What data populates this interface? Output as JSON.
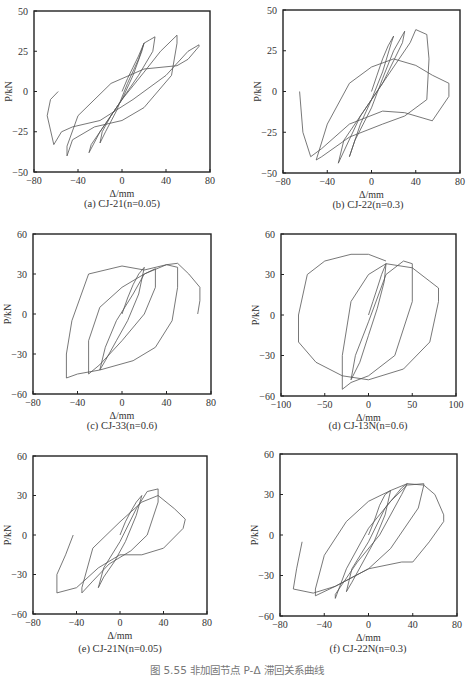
{
  "figure_caption": "图 5.55  非加固节点 P-Δ 滞回关系曲线",
  "chart_data": [
    {
      "id": "a",
      "type": "line",
      "title": "(a) CJ-21(n=0.05)",
      "xlabel": "Δ/mm",
      "ylabel": "P/kN",
      "xlim": [
        -80,
        80
      ],
      "ylim": [
        -50,
        50
      ],
      "xticks": [
        -80,
        -40,
        0,
        40,
        80
      ],
      "yticks": [
        -50,
        -25,
        0,
        25,
        50
      ],
      "grid": false,
      "series": [
        {
          "name": "hysteresis",
          "x": [
            0,
            5,
            10,
            15,
            20,
            18,
            10,
            0,
            -10,
            -18,
            -20,
            -15,
            -5,
            5,
            15,
            20,
            25,
            30,
            28,
            15,
            0,
            -15,
            -28,
            -30,
            -20,
            0,
            20,
            35,
            50,
            50,
            45,
            20,
            0,
            -25,
            -45,
            -50,
            -50,
            -40,
            -10,
            20,
            50,
            60,
            70,
            70,
            60,
            40,
            10,
            -20,
            -45,
            -55,
            -62,
            -68,
            -65,
            -58
          ],
          "y": [
            0,
            8,
            15,
            22,
            30,
            25,
            10,
            -5,
            -15,
            -25,
            -32,
            -25,
            -12,
            5,
            20,
            30,
            32,
            34,
            25,
            10,
            -5,
            -20,
            -33,
            -38,
            -25,
            -5,
            12,
            25,
            35,
            30,
            10,
            -10,
            -18,
            -22,
            -30,
            -40,
            -34,
            -15,
            5,
            14,
            16,
            20,
            28,
            29,
            25,
            10,
            -5,
            -18,
            -22,
            -25,
            -33,
            -15,
            -5,
            0
          ]
        }
      ]
    },
    {
      "id": "b",
      "type": "line",
      "title": "(b) CJ-22(n=0.3)",
      "xlabel": "Δ/mm",
      "ylabel": "P/kN",
      "xlim": [
        -80,
        80
      ],
      "ylim": [
        -50,
        50
      ],
      "xticks": [
        -80,
        -40,
        0,
        40,
        80
      ],
      "yticks": [
        -50,
        -25,
        0,
        25,
        50
      ],
      "grid": false,
      "series": [
        {
          "name": "hysteresis",
          "x": [
            0,
            5,
            10,
            15,
            20,
            18,
            10,
            0,
            -10,
            -20,
            -15,
            0,
            10,
            20,
            30,
            28,
            10,
            -10,
            -30,
            -25,
            0,
            20,
            35,
            40,
            50,
            52,
            50,
            30,
            10,
            -20,
            -45,
            -50,
            -40,
            -20,
            0,
            20,
            40,
            55,
            70,
            70,
            55,
            30,
            10,
            -20,
            -45,
            -55,
            -62,
            -65
          ],
          "y": [
            0,
            10,
            20,
            28,
            34,
            30,
            12,
            -5,
            -20,
            -40,
            -30,
            -10,
            8,
            25,
            37,
            30,
            5,
            -15,
            -44,
            -30,
            -5,
            15,
            30,
            38,
            35,
            20,
            -5,
            -15,
            -20,
            -28,
            -40,
            -42,
            -20,
            5,
            15,
            20,
            16,
            10,
            5,
            -3,
            -18,
            -13,
            -12,
            -20,
            -35,
            -40,
            -25,
            0
          ]
        }
      ]
    },
    {
      "id": "c",
      "type": "line",
      "title": "(c) CJ-33(n=0.6)",
      "xlabel": "Δ/mm",
      "ylabel": "P/kN",
      "xlim": [
        -80,
        80
      ],
      "ylim": [
        -60,
        60
      ],
      "xticks": [
        -80,
        -40,
        0,
        40,
        80
      ],
      "yticks": [
        -60,
        -30,
        0,
        30,
        60
      ],
      "grid": false,
      "series": [
        {
          "name": "hysteresis",
          "x": [
            0,
            5,
            10,
            15,
            20,
            15,
            5,
            -5,
            -15,
            -20,
            -15,
            -5,
            10,
            20,
            30,
            30,
            20,
            0,
            -20,
            -30,
            -30,
            -20,
            0,
            20,
            40,
            50,
            50,
            45,
            30,
            10,
            -20,
            -40,
            -50,
            -50,
            -45,
            -30,
            0,
            20,
            40,
            50,
            60,
            70,
            70,
            68
          ],
          "y": [
            0,
            12,
            22,
            30,
            35,
            15,
            -5,
            -20,
            -35,
            -42,
            -25,
            -5,
            15,
            30,
            34,
            20,
            0,
            -20,
            -38,
            -45,
            -20,
            5,
            20,
            30,
            37,
            35,
            20,
            -5,
            -25,
            -35,
            -42,
            -45,
            -48,
            -30,
            -5,
            30,
            36,
            33,
            37,
            38,
            30,
            20,
            10,
            0
          ]
        }
      ]
    },
    {
      "id": "d",
      "type": "line",
      "title": "(d) CJ-13N(n=0.6)",
      "xlabel": "Δ/mm",
      "ylabel": "P/kN",
      "xlim": [
        -100,
        100
      ],
      "ylim": [
        -60,
        60
      ],
      "xticks": [
        -100,
        -50,
        0,
        50,
        100
      ],
      "yticks": [
        -60,
        -30,
        0,
        30,
        60
      ],
      "grid": false,
      "series": [
        {
          "name": "hysteresis",
          "x": [
            0,
            5,
            10,
            15,
            20,
            18,
            10,
            0,
            -10,
            -20,
            -15,
            0,
            20,
            40,
            50,
            50,
            30,
            0,
            -20,
            -30,
            -30,
            -20,
            0,
            20,
            50,
            70,
            80,
            80,
            70,
            40,
            0,
            -30,
            -60,
            -80,
            -80,
            -70,
            -50,
            -20,
            0,
            20
          ],
          "y": [
            0,
            10,
            20,
            30,
            38,
            25,
            5,
            -15,
            -35,
            -48,
            -30,
            -5,
            30,
            40,
            38,
            10,
            -30,
            -45,
            -50,
            -55,
            -30,
            10,
            30,
            38,
            35,
            25,
            20,
            10,
            -20,
            -40,
            -48,
            -45,
            -35,
            -20,
            0,
            30,
            40,
            45,
            45,
            40
          ]
        }
      ]
    },
    {
      "id": "e",
      "type": "line",
      "title": "(e) CJ-21N(n=0.05)",
      "xlabel": "Δ/mm",
      "ylabel": "P/kN",
      "xlim": [
        -80,
        80
      ],
      "ylim": [
        -60,
        60
      ],
      "xticks": [
        -80,
        -40,
        0,
        40,
        80
      ],
      "yticks": [
        -60,
        -30,
        0,
        30,
        60
      ],
      "grid": false,
      "series": [
        {
          "name": "hysteresis",
          "x": [
            0,
            5,
            10,
            15,
            20,
            15,
            5,
            -5,
            -15,
            -20,
            -15,
            0,
            15,
            25,
            35,
            35,
            25,
            10,
            -10,
            -25,
            -35,
            -35,
            -25,
            0,
            20,
            35,
            50,
            60,
            58,
            40,
            20,
            0,
            -20,
            -40,
            -58,
            -58,
            -50,
            -43
          ],
          "y": [
            0,
            10,
            18,
            25,
            30,
            15,
            -5,
            -20,
            -32,
            -40,
            -25,
            -5,
            20,
            33,
            35,
            25,
            0,
            -12,
            -22,
            -35,
            -44,
            -40,
            -10,
            10,
            25,
            30,
            20,
            12,
            5,
            -10,
            -15,
            -15,
            -25,
            -40,
            -44,
            -30,
            -15,
            0
          ]
        }
      ]
    },
    {
      "id": "f",
      "type": "line",
      "title": "(f) CJ-22N(n=0.3)",
      "xlabel": "Δ/mm",
      "ylabel": "P/kN",
      "xlim": [
        -80,
        80
      ],
      "ylim": [
        -60,
        60
      ],
      "xticks": [
        -80,
        -40,
        0,
        40,
        80
      ],
      "yticks": [
        -60,
        -30,
        0,
        30,
        60
      ],
      "grid": false,
      "series": [
        {
          "name": "hysteresis",
          "x": [
            0,
            5,
            10,
            15,
            20,
            15,
            5,
            -5,
            -15,
            -20,
            -15,
            0,
            15,
            30,
            35,
            30,
            10,
            -10,
            -30,
            -30,
            -20,
            0,
            20,
            35,
            50,
            50,
            45,
            20,
            0,
            -30,
            -48,
            -48,
            -40,
            -20,
            0,
            20,
            35,
            50,
            60,
            68,
            68,
            55,
            40,
            30,
            0,
            -30,
            -50,
            -68,
            -65,
            -60
          ],
          "y": [
            0,
            10,
            22,
            30,
            33,
            15,
            -5,
            -20,
            -35,
            -42,
            -25,
            -5,
            20,
            35,
            38,
            30,
            0,
            -20,
            -44,
            -47,
            -25,
            5,
            25,
            37,
            38,
            37,
            20,
            -10,
            -25,
            -38,
            -45,
            -40,
            -15,
            10,
            25,
            33,
            38,
            37,
            30,
            15,
            10,
            -5,
            -20,
            -20,
            -25,
            -38,
            -43,
            -40,
            -25,
            -5
          ]
        }
      ]
    }
  ]
}
